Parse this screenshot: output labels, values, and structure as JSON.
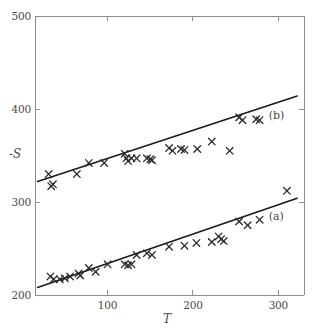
{
  "chart_data": {
    "type": "scatter",
    "title": "",
    "subtitle": "",
    "xlabel": "T",
    "ylabel": "-S",
    "xlim": [
      15,
      330
    ],
    "ylim": [
      200,
      500
    ],
    "xticks": [
      100,
      200,
      300
    ],
    "xtick_labels": [
      "100",
      "200",
      "300"
    ],
    "yticks": [
      200,
      300,
      400,
      500
    ],
    "ytick_labels": [
      "200",
      "300",
      "400",
      "500"
    ],
    "grid": false,
    "legend_position": "inline-right",
    "marker": "x",
    "marker_color": "#2a2a2a",
    "line_color": "#1a1a1a",
    "axis_color": "#8d8d8d",
    "series": [
      {
        "name": "(b)",
        "label": "(b)",
        "annotation_x": 298,
        "annotation_y": 392,
        "fit_line": {
          "x0": 18,
          "y0": 322,
          "x1": 322,
          "y1": 414
        },
        "points": [
          {
            "x": 31,
            "y": 330
          },
          {
            "x": 34,
            "y": 317
          },
          {
            "x": 36,
            "y": 319
          },
          {
            "x": 64,
            "y": 330
          },
          {
            "x": 78,
            "y": 342
          },
          {
            "x": 96,
            "y": 342
          },
          {
            "x": 120,
            "y": 352
          },
          {
            "x": 122,
            "y": 347
          },
          {
            "x": 124,
            "y": 344
          },
          {
            "x": 128,
            "y": 347
          },
          {
            "x": 134,
            "y": 347
          },
          {
            "x": 146,
            "y": 347
          },
          {
            "x": 150,
            "y": 346
          },
          {
            "x": 152,
            "y": 345
          },
          {
            "x": 172,
            "y": 358
          },
          {
            "x": 176,
            "y": 355
          },
          {
            "x": 186,
            "y": 357
          },
          {
            "x": 190,
            "y": 356
          },
          {
            "x": 205,
            "y": 357
          },
          {
            "x": 222,
            "y": 365
          },
          {
            "x": 243,
            "y": 355
          },
          {
            "x": 254,
            "y": 391
          },
          {
            "x": 258,
            "y": 388
          },
          {
            "x": 274,
            "y": 389
          },
          {
            "x": 278,
            "y": 388
          }
        ]
      },
      {
        "name": "(a)",
        "label": "(a)",
        "annotation_x": 298,
        "annotation_y": 284,
        "fit_line": {
          "x0": 18,
          "y0": 208,
          "x1": 322,
          "y1": 304
        },
        "points": [
          {
            "x": 33,
            "y": 220
          },
          {
            "x": 37,
            "y": 217
          },
          {
            "x": 44,
            "y": 217
          },
          {
            "x": 50,
            "y": 218
          },
          {
            "x": 56,
            "y": 220
          },
          {
            "x": 66,
            "y": 223
          },
          {
            "x": 68,
            "y": 221
          },
          {
            "x": 78,
            "y": 229
          },
          {
            "x": 86,
            "y": 225
          },
          {
            "x": 100,
            "y": 233
          },
          {
            "x": 120,
            "y": 233
          },
          {
            "x": 124,
            "y": 232
          },
          {
            "x": 128,
            "y": 233
          },
          {
            "x": 134,
            "y": 243
          },
          {
            "x": 146,
            "y": 245
          },
          {
            "x": 152,
            "y": 243
          },
          {
            "x": 172,
            "y": 252
          },
          {
            "x": 190,
            "y": 253
          },
          {
            "x": 204,
            "y": 256
          },
          {
            "x": 222,
            "y": 257
          },
          {
            "x": 230,
            "y": 263
          },
          {
            "x": 233,
            "y": 260
          },
          {
            "x": 236,
            "y": 258
          },
          {
            "x": 254,
            "y": 279
          },
          {
            "x": 264,
            "y": 275
          },
          {
            "x": 278,
            "y": 281
          },
          {
            "x": 310,
            "y": 312
          }
        ]
      }
    ]
  }
}
